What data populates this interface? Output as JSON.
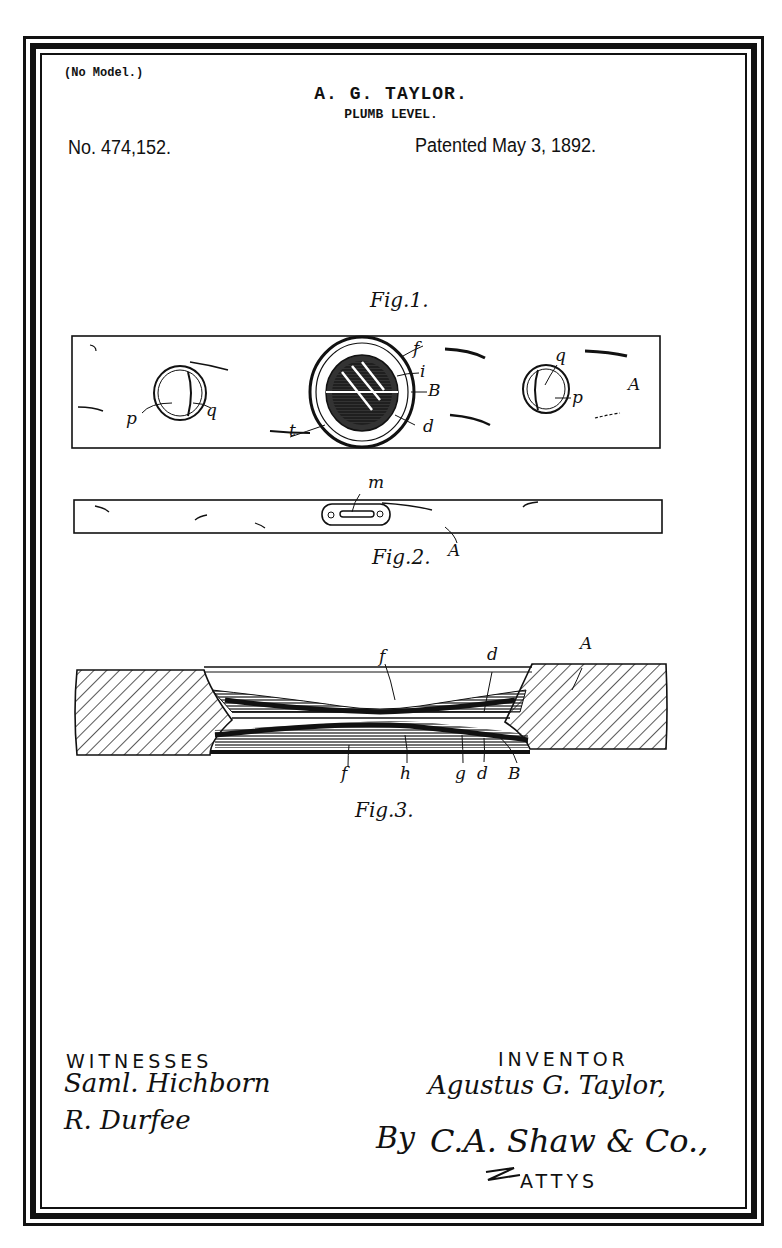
{
  "header": {
    "model_note": "(No Model.)",
    "inventor": "A. G. TAYLOR.",
    "title": "PLUMB LEVEL.",
    "patent_number": "No. 474,152.",
    "patent_date": "Patented May 3, 1892."
  },
  "figures": {
    "fig1": {
      "caption": "Fig.1.",
      "labels": [
        "f",
        "i",
        "B",
        "d",
        "t",
        "p",
        "q",
        "q",
        "p",
        "A"
      ]
    },
    "fig2": {
      "caption": "Fig.2.",
      "labels": [
        "m",
        "A"
      ]
    },
    "fig3": {
      "caption": "Fig.3.",
      "labels": [
        "f",
        "d",
        "A",
        "f",
        "h",
        "g",
        "d",
        "B"
      ]
    }
  },
  "footer": {
    "witnesses_heading": "WITNESSES",
    "witness_1": "Saml. Hichborn",
    "witness_2": "R. Durfee",
    "inventor_heading": "INVENTOR",
    "inventor_signature": "Agustus G. Taylor,",
    "by_label": "By",
    "attorney_signature": "C.A. Shaw & Co.,",
    "attys_label": "ATTYS"
  }
}
